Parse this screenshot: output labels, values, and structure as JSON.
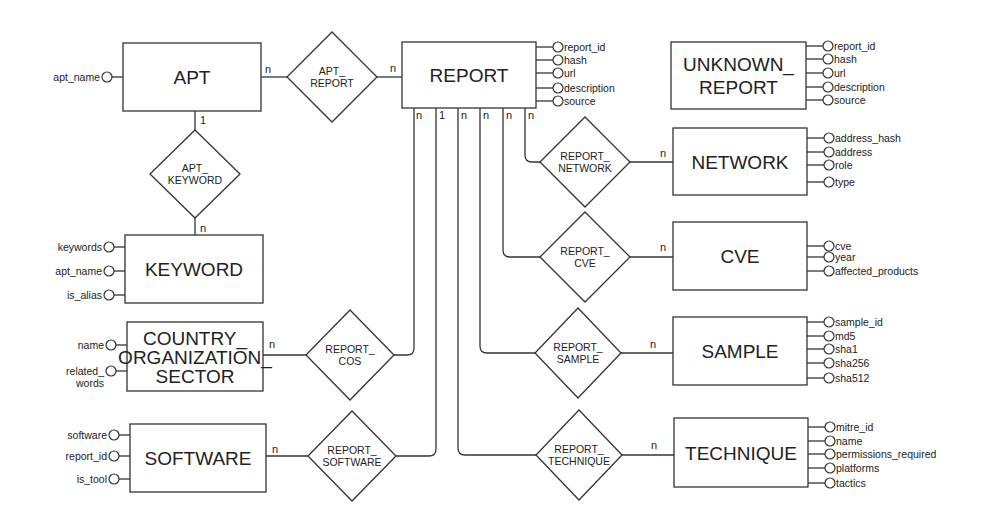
{
  "colors": {
    "stroke": "#333333",
    "text": "#222222",
    "background": "#ffffff"
  },
  "entities": [
    {
      "id": "apt",
      "lines": [
        "APT"
      ],
      "x": 123,
      "y": 43,
      "w": 138,
      "h": 68,
      "attr_side": "left",
      "attributes": [
        {
          "label": "apt_name",
          "y": 77
        }
      ]
    },
    {
      "id": "report",
      "lines": [
        "REPORT"
      ],
      "x": 402,
      "y": 42,
      "w": 134,
      "h": 66,
      "attr_side": "right",
      "attributes": [
        {
          "label": "report_id",
          "y": 47
        },
        {
          "label": "hash",
          "y": 60
        },
        {
          "label": "url",
          "y": 73
        },
        {
          "label": "description",
          "y": 88
        },
        {
          "label": "source",
          "y": 101
        }
      ]
    },
    {
      "id": "unknown_report",
      "lines": [
        "UNKNOWN_",
        "REPORT"
      ],
      "x": 671,
      "y": 42,
      "w": 135,
      "h": 67,
      "attr_side": "right",
      "attributes": [
        {
          "label": "report_id",
          "y": 46
        },
        {
          "label": "hash",
          "y": 59
        },
        {
          "label": "url",
          "y": 73
        },
        {
          "label": "description",
          "y": 87
        },
        {
          "label": "source",
          "y": 100
        }
      ]
    },
    {
      "id": "network",
      "lines": [
        "NETWORK"
      ],
      "x": 673,
      "y": 128,
      "w": 134,
      "h": 67,
      "attr_side": "right",
      "attributes": [
        {
          "label": "address_hash",
          "y": 138
        },
        {
          "label": "address",
          "y": 152
        },
        {
          "label": "role",
          "y": 165
        },
        {
          "label": "type",
          "y": 182
        }
      ]
    },
    {
      "id": "cve",
      "lines": [
        "CVE"
      ],
      "x": 673,
      "y": 222,
      "w": 134,
      "h": 68,
      "attr_side": "right",
      "attributes": [
        {
          "label": "cve",
          "y": 246
        },
        {
          "label": "year",
          "y": 257
        },
        {
          "label": "affected_products",
          "y": 271
        }
      ]
    },
    {
      "id": "sample",
      "lines": [
        "SAMPLE"
      ],
      "x": 673,
      "y": 317,
      "w": 134,
      "h": 68,
      "attr_side": "right",
      "attributes": [
        {
          "label": "sample_id",
          "y": 322
        },
        {
          "label": "md5",
          "y": 336
        },
        {
          "label": "sha1",
          "y": 349
        },
        {
          "label": "sha256",
          "y": 363
        },
        {
          "label": "sha512",
          "y": 378
        }
      ]
    },
    {
      "id": "technique",
      "lines": [
        "TECHNIQUE"
      ],
      "x": 674,
      "y": 418,
      "w": 134,
      "h": 69,
      "attr_side": "right",
      "attributes": [
        {
          "label": "mitre_id",
          "y": 427
        },
        {
          "label": "name",
          "y": 441
        },
        {
          "label": "permissions_required",
          "y": 454
        },
        {
          "label": "platforms",
          "y": 468
        },
        {
          "label": "tactics",
          "y": 483
        }
      ]
    },
    {
      "id": "keyword",
      "lines": [
        "KEYWORD"
      ],
      "x": 125,
      "y": 235,
      "w": 138,
      "h": 68,
      "attr_side": "left",
      "attributes": [
        {
          "label": "keywords",
          "y": 247
        },
        {
          "label": "apt_name",
          "y": 271
        },
        {
          "label": "is_alias",
          "y": 295
        }
      ]
    },
    {
      "id": "country_organization_sector",
      "lines": [
        "COUNTRY_",
        "ORGANIZATION_",
        "SECTOR"
      ],
      "x": 127,
      "y": 322,
      "w": 136,
      "h": 69,
      "attr_side": "left",
      "attributes": [
        {
          "label": "name",
          "y": 345
        },
        {
          "label": "related_",
          "label2": "words",
          "y": 371
        }
      ]
    },
    {
      "id": "software",
      "lines": [
        "SOFTWARE"
      ],
      "x": 130,
      "y": 424,
      "w": 136,
      "h": 68,
      "attr_side": "left",
      "attributes": [
        {
          "label": "software",
          "y": 435
        },
        {
          "label": "report_id",
          "y": 456
        },
        {
          "label": "is_tool",
          "y": 479
        }
      ]
    }
  ],
  "relationships": [
    {
      "id": "apt_report",
      "lines": [
        "APT_",
        "REPORT"
      ],
      "cx": 332,
      "cy": 77,
      "hw": 45,
      "hh": 45
    },
    {
      "id": "apt_keyword",
      "lines": [
        "APT_",
        "KEYWORD"
      ],
      "cx": 195,
      "cy": 174,
      "hw": 45,
      "hh": 44
    },
    {
      "id": "report_network",
      "lines": [
        "REPORT_",
        "NETWORK"
      ],
      "cx": 585,
      "cy": 162,
      "hw": 45,
      "hh": 45
    },
    {
      "id": "report_cve",
      "lines": [
        "REPORT_",
        "CVE"
      ],
      "cx": 585,
      "cy": 257,
      "hw": 45,
      "hh": 45
    },
    {
      "id": "report_sample",
      "lines": [
        "REPORT_",
        "SAMPLE"
      ],
      "cx": 578,
      "cy": 353,
      "hw": 43,
      "hh": 45
    },
    {
      "id": "report_technique",
      "lines": [
        "REPORT_",
        "TECHNIQUE"
      ],
      "cx": 579,
      "cy": 455,
      "hw": 43,
      "hh": 45
    },
    {
      "id": "report_cos",
      "lines": [
        "REPORT_",
        "COS"
      ],
      "cx": 350,
      "cy": 355,
      "hw": 44,
      "hh": 45
    },
    {
      "id": "report_software",
      "lines": [
        "REPORT_",
        "SOFTWARE"
      ],
      "cx": 352,
      "cy": 456,
      "hw": 44,
      "hh": 45
    }
  ],
  "connections": [
    {
      "id": "apt-to-apt_report",
      "path": "M261 77 L287 77",
      "card": {
        "text": "n",
        "x": 265,
        "y": 73
      }
    },
    {
      "id": "apt_report-to-report",
      "path": "M377 77 L402 77",
      "card": {
        "text": "n",
        "x": 390,
        "y": 72
      }
    },
    {
      "id": "apt-to-apt_keyword",
      "path": "M195 111 L195 130",
      "card": {
        "text": "1",
        "x": 200,
        "y": 124
      }
    },
    {
      "id": "apt_keyword-to-keyword",
      "path": "M195 218 L195 235",
      "card": {
        "text": "n",
        "x": 200,
        "y": 232
      }
    },
    {
      "id": "report-to-report_cos",
      "path": "M414 108 L414 348 Q414 355 407 355 L394 355",
      "card": {
        "text": "n",
        "x": 416,
        "y": 119
      }
    },
    {
      "id": "report-to-report_software",
      "path": "M436 108 L436 449 Q436 456 429 456 L396 456",
      "card": {
        "text": "1",
        "x": 439,
        "y": 119
      }
    },
    {
      "id": "report-to-report_technique",
      "path": "M458 108 L458 448 Q458 455 465 455 L536 455",
      "card": {
        "text": "n",
        "x": 461,
        "y": 119
      }
    },
    {
      "id": "report-to-report_sample",
      "path": "M480 108 L480 346 Q480 353 487 353 L535 353",
      "card": {
        "text": "n",
        "x": 483,
        "y": 119
      }
    },
    {
      "id": "report-to-report_cve",
      "path": "M503 108 L503 250 Q503 257 510 257 L540 257",
      "card": {
        "text": "n",
        "x": 506,
        "y": 119
      }
    },
    {
      "id": "report-to-report_network",
      "path": "M525 108 L525 155 Q525 162 532 162 L540 162",
      "card": {
        "text": "n",
        "x": 528,
        "y": 119
      }
    },
    {
      "id": "report_network-to-network",
      "path": "M630 162 L673 162",
      "card": {
        "text": "n",
        "x": 660,
        "y": 157
      }
    },
    {
      "id": "report_cve-to-cve",
      "path": "M630 257 L673 257",
      "card": {
        "text": "n",
        "x": 660,
        "y": 251
      }
    },
    {
      "id": "report_sample-to-sample",
      "path": "M621 353 L673 353",
      "card": {
        "text": "n",
        "x": 650,
        "y": 348
      }
    },
    {
      "id": "report_technique-to-technique",
      "path": "M622 455 L674 455",
      "card": {
        "text": "n",
        "x": 651,
        "y": 449
      }
    },
    {
      "id": "cos-to-report_cos",
      "path": "M263 355 L306 355",
      "card": {
        "text": "n",
        "x": 269,
        "y": 348
      }
    },
    {
      "id": "software-to-report_software",
      "path": "M266 456 L308 456",
      "card": {
        "text": "n",
        "x": 272,
        "y": 453
      }
    }
  ]
}
